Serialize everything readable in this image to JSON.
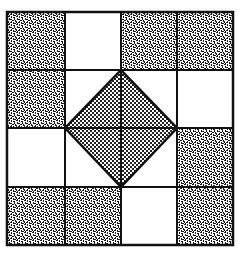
{
  "figure": {
    "title": "",
    "grid": {
      "rows": 4,
      "cols": 4,
      "x_lines": [
        7,
        65,
        121,
        177,
        233
      ],
      "y_lines": [
        12,
        70,
        128,
        187,
        245
      ]
    },
    "shaded_cells": [
      [
        0,
        0
      ],
      [
        0,
        2
      ],
      [
        0,
        3
      ],
      [
        1,
        0
      ],
      [
        2,
        3
      ],
      [
        3,
        0
      ],
      [
        3,
        1
      ],
      [
        3,
        3
      ]
    ],
    "diamond": {
      "top": [
        121,
        70
      ],
      "right": [
        177,
        128
      ],
      "bottom": [
        121,
        187
      ],
      "left": [
        65,
        128
      ]
    },
    "colors": {
      "line": "#111111",
      "background": "#ffffff",
      "speckle_dark": "#1a1a1a",
      "dot": "#222222"
    }
  }
}
